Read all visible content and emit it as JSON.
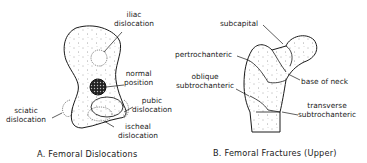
{
  "panel_a": {
    "caption": "A. Femoral Dislocations",
    "labels": {
      "iliac_1": "iliac",
      "iliac_2": "dislocation",
      "normal_1": "normal",
      "normal_2": "position",
      "pubic_1": "pubic",
      "pubic_2": "dislocation",
      "sciatic_1": "sciatic",
      "sciatic_2": "dislocation",
      "ischeal_1": "ischeal",
      "ischeal_2": "dislocation"
    }
  },
  "panel_b": {
    "caption": "B. Femoral Fractures (Upper)",
    "labels": {
      "subcapital": "subcapital",
      "pertrochanteric": "pertrochanteric",
      "oblique_1": "oblique",
      "oblique_2": "subtrochanteric",
      "base_of_neck": "base of neck",
      "transverse_1": "transverse",
      "transverse_2": "subtrochanteric"
    }
  },
  "colors": {
    "ink": "#1a1a1a",
    "background": "#ffffff"
  }
}
